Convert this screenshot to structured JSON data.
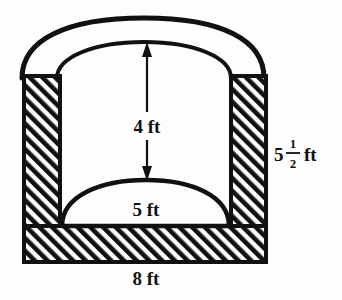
{
  "figure": {
    "colors": {
      "background": "#fdfdfd",
      "outline": "#111111",
      "hatch": "#111111",
      "cavity": "#fdfdfd"
    },
    "shapes": {
      "outer_arch": "outer-arch-outline",
      "inner_arch": "inner-arch-outline",
      "left_wall": "left-hatched-wall",
      "right_wall": "right-hatched-wall",
      "floor": "bottom-hatched-floor",
      "mound": "floor-dome"
    }
  },
  "dimensions": {
    "height_interior": {
      "value": "4 ft",
      "name": "interior-height-label",
      "arrow": "double-headed-vertical-arrow"
    },
    "mound_span": {
      "value": "5 ft",
      "name": "mound-span-label"
    },
    "overall_height": {
      "whole": "5",
      "numerator": "1",
      "denominator": "2",
      "unit": "ft",
      "name": "overall-height-label"
    },
    "overall_width": {
      "value": "8 ft",
      "name": "overall-width-label"
    }
  }
}
